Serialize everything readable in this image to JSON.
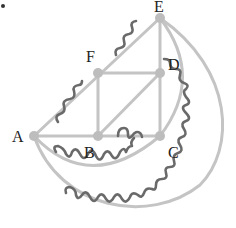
{
  "diagram": {
    "title": "",
    "colors": {
      "edge": "#c4c4c4",
      "node": "#bdbdbd",
      "wavy": "#6a6a6a",
      "label": "#222222"
    },
    "nodes": [
      {
        "id": "A",
        "label": "A",
        "x": 34,
        "y": 136
      },
      {
        "id": "B",
        "label": "B",
        "x": 98,
        "y": 136
      },
      {
        "id": "C",
        "label": "C",
        "x": 160,
        "y": 136
      },
      {
        "id": "D",
        "label": "D",
        "x": 160,
        "y": 73
      },
      {
        "id": "E",
        "label": "E",
        "x": 160,
        "y": 18
      },
      {
        "id": "F",
        "label": "F",
        "x": 98,
        "y": 73
      }
    ],
    "edges": [
      {
        "from": "A",
        "to": "B",
        "type": "straight"
      },
      {
        "from": "B",
        "to": "C",
        "type": "straight",
        "wavy": true
      },
      {
        "from": "A",
        "to": "E",
        "type": "straight",
        "wavy": true
      },
      {
        "from": "B",
        "to": "F",
        "type": "straight"
      },
      {
        "from": "F",
        "to": "D",
        "type": "straight"
      },
      {
        "from": "B",
        "to": "D",
        "type": "straight"
      },
      {
        "from": "C",
        "to": "D",
        "type": "straight"
      },
      {
        "from": "D",
        "to": "E",
        "type": "straight"
      },
      {
        "from": "E",
        "to": "C",
        "type": "arc"
      },
      {
        "from": "A",
        "to": "C",
        "type": "arc",
        "wavy": true
      },
      {
        "from": "A",
        "to": "E",
        "type": "outer-arc",
        "wavy": true
      }
    ],
    "marker": {
      "x": 3,
      "y": 6
    }
  }
}
